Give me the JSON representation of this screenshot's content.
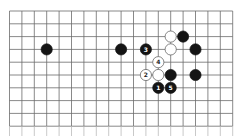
{
  "diagram": {
    "type": "go-board-fragment",
    "grid": {
      "columns": 19,
      "rows_visible": 10,
      "origin_x": 9.5,
      "origin_y": 11,
      "spacing_x": 12.4,
      "spacing_y": 12.8,
      "line_color": "#6b6b6b",
      "background": "#ffffff",
      "bottom_open": true
    },
    "colors": {
      "black_stone": "#141414",
      "white_stone": "#ffffff",
      "white_stone_edge": "#555555",
      "label_on_black": "#ffffff",
      "label_on_white": "#222222"
    },
    "stones": [
      {
        "color": "black",
        "col": 3,
        "row": 3,
        "label": ""
      },
      {
        "color": "black",
        "col": 9,
        "row": 3,
        "label": ""
      },
      {
        "color": "black",
        "col": 11,
        "row": 3,
        "label": "3"
      },
      {
        "color": "white",
        "col": 13,
        "row": 2,
        "label": ""
      },
      {
        "color": "black",
        "col": 14,
        "row": 2,
        "label": ""
      },
      {
        "color": "white",
        "col": 13,
        "row": 3,
        "label": ""
      },
      {
        "color": "black",
        "col": 15,
        "row": 3,
        "label": ""
      },
      {
        "color": "white",
        "col": 12,
        "row": 4,
        "label": "4"
      },
      {
        "color": "white",
        "col": 11,
        "row": 5,
        "label": "2"
      },
      {
        "color": "white",
        "col": 12,
        "row": 5,
        "label": ""
      },
      {
        "color": "black",
        "col": 13,
        "row": 5,
        "label": ""
      },
      {
        "color": "black",
        "col": 15,
        "row": 5,
        "label": ""
      },
      {
        "color": "black",
        "col": 12,
        "row": 6,
        "label": "1"
      },
      {
        "color": "black",
        "col": 13,
        "row": 6,
        "label": "5"
      }
    ]
  }
}
